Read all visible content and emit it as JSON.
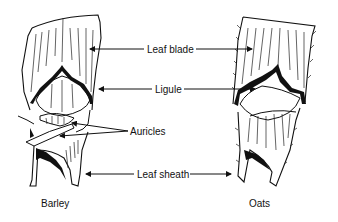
{
  "diagram": {
    "labels": {
      "leaf_blade": "Leaf blade",
      "ligule": "Ligule",
      "auricles": "Auricles",
      "leaf_sheath": "Leaf sheath"
    },
    "specimens": [
      {
        "name": "Barley",
        "parts": [
          "Leaf blade",
          "Ligule",
          "Auricles",
          "Leaf sheath"
        ]
      },
      {
        "name": "Oats",
        "parts": [
          "Leaf blade",
          "Ligule",
          "Leaf sheath"
        ]
      }
    ],
    "colors": {
      "ink": "#111111",
      "background": "#ffffff"
    }
  }
}
